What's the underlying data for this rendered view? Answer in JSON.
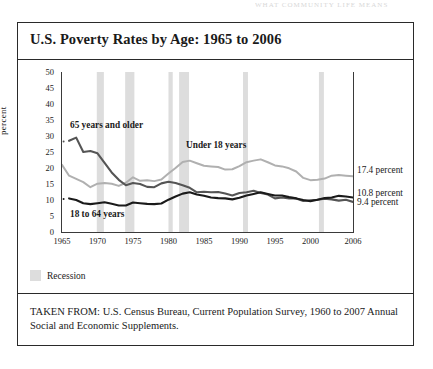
{
  "page_header_faint": "WHAT COMMUNITY LIFE MEANS",
  "chart_title": "U.S. Poverty Rates by Age: 1965 to 2006",
  "legend": {
    "recession_label": "Recession",
    "recession_color": "#dddddd"
  },
  "source_note": "TAKEN FROM: U.S. Census Bureau, Current Population Survey, 1960 to 2007 Annual Social and Economic Supplements.",
  "annotations": {
    "older": "65 years and older",
    "under18": "Under 18 years",
    "working": "18 to 64 years"
  },
  "end_labels": {
    "under18": "17.4 percent",
    "working": "10.8 percent",
    "older": "9.4 percent"
  },
  "chart_data": {
    "type": "line",
    "title": "U.S. Poverty Rates by Age: 1965 to 2006",
    "xlabel": "",
    "ylabel": "percent",
    "xlim": [
      1965,
      2006
    ],
    "ylim": [
      0,
      50
    ],
    "yticks": [
      0,
      5,
      10,
      15,
      20,
      25,
      30,
      35,
      40,
      45,
      50
    ],
    "xticks": [
      1965,
      1970,
      1975,
      1980,
      1985,
      1990,
      1995,
      2000,
      2006
    ],
    "grid": false,
    "legend_position": "inline-annotations",
    "series": [
      {
        "name": "Under 18 years",
        "color": "#b0b0b0",
        "end_value": 17.4,
        "x": [
          1965,
          1966,
          1967,
          1968,
          1969,
          1970,
          1971,
          1972,
          1973,
          1974,
          1975,
          1976,
          1977,
          1978,
          1979,
          1980,
          1981,
          1982,
          1983,
          1984,
          1985,
          1986,
          1987,
          1988,
          1989,
          1990,
          1991,
          1992,
          1993,
          1994,
          1995,
          1996,
          1997,
          1998,
          1999,
          2000,
          2001,
          2002,
          2003,
          2004,
          2005,
          2006
        ],
        "values": [
          21.0,
          17.6,
          16.6,
          15.6,
          14.0,
          15.1,
          15.3,
          15.1,
          14.4,
          15.4,
          17.1,
          16.0,
          16.2,
          15.9,
          16.4,
          18.3,
          20.0,
          21.9,
          22.3,
          21.5,
          20.7,
          20.5,
          20.3,
          19.5,
          19.6,
          20.6,
          21.8,
          22.3,
          22.7,
          21.8,
          20.8,
          20.5,
          19.9,
          18.9,
          16.9,
          16.2,
          16.3,
          16.7,
          17.6,
          17.8,
          17.6,
          17.4
        ]
      },
      {
        "name": "65 years and older",
        "color": "#555555",
        "end_value": 9.4,
        "x": [
          1966,
          1967,
          1968,
          1969,
          1970,
          1971,
          1972,
          1973,
          1974,
          1975,
          1976,
          1977,
          1978,
          1979,
          1980,
          1981,
          1982,
          1983,
          1984,
          1985,
          1986,
          1987,
          1988,
          1989,
          1990,
          1991,
          1992,
          1993,
          1994,
          1995,
          1996,
          1997,
          1998,
          1999,
          2000,
          2001,
          2002,
          2003,
          2004,
          2005,
          2006
        ],
        "values": [
          28.5,
          29.5,
          25.0,
          25.3,
          24.6,
          21.6,
          18.6,
          16.3,
          14.6,
          15.3,
          15.0,
          14.1,
          14.0,
          15.2,
          15.7,
          15.3,
          14.6,
          13.8,
          12.4,
          12.6,
          12.4,
          12.5,
          12.0,
          11.4,
          12.2,
          12.4,
          12.9,
          12.2,
          11.7,
          10.5,
          10.8,
          10.5,
          10.5,
          9.7,
          9.9,
          10.1,
          10.4,
          10.2,
          9.8,
          10.1,
          9.4
        ]
      },
      {
        "name": "18 to 64 years",
        "color": "#1a1a1a",
        "end_value": 10.8,
        "x": [
          1966,
          1967,
          1968,
          1969,
          1970,
          1971,
          1972,
          1973,
          1974,
          1975,
          1976,
          1977,
          1978,
          1979,
          1980,
          1981,
          1982,
          1983,
          1984,
          1985,
          1986,
          1987,
          1988,
          1989,
          1990,
          1991,
          1992,
          1993,
          1994,
          1995,
          1996,
          1997,
          1998,
          1999,
          2000,
          2001,
          2002,
          2003,
          2004,
          2005,
          2006
        ],
        "values": [
          10.5,
          10.0,
          9.0,
          8.7,
          9.0,
          9.3,
          8.8,
          8.3,
          8.3,
          9.2,
          9.0,
          8.8,
          8.7,
          8.9,
          10.1,
          11.1,
          12.0,
          12.4,
          11.7,
          11.3,
          10.8,
          10.6,
          10.5,
          10.2,
          10.7,
          11.4,
          11.9,
          12.4,
          11.9,
          11.4,
          11.4,
          10.9,
          10.5,
          10.0,
          9.6,
          10.1,
          10.6,
          10.8,
          11.3,
          11.1,
          10.8
        ]
      }
    ],
    "recession_bands": [
      [
        1969.9,
        1970.9
      ],
      [
        1973.9,
        1975.2
      ],
      [
        1980.0,
        1980.6
      ],
      [
        1981.5,
        1982.9
      ],
      [
        1990.5,
        1991.2
      ],
      [
        2001.2,
        2001.9
      ]
    ]
  }
}
